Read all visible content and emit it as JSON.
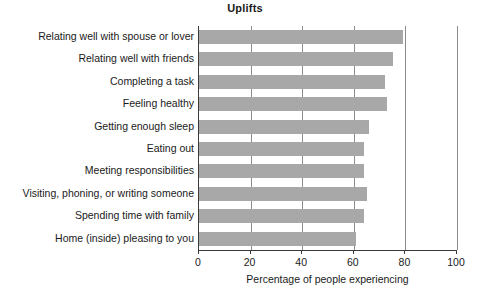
{
  "chart_data": {
    "type": "bar",
    "orientation": "horizontal",
    "title": "Uplifts",
    "xlabel": "Percentage of people experiencing",
    "ylabel": "",
    "xlim": [
      0,
      100
    ],
    "xticks": [
      0,
      20,
      40,
      60,
      80,
      100
    ],
    "grid": true,
    "legend": false,
    "bar_color": "#a8a8a8",
    "axis_color": "#3a3a3a",
    "gridline_color": "#8c8c8c",
    "categories": [
      "Relating well with spouse or lover",
      "Relating well with friends",
      "Completing a task",
      "Feeling healthy",
      "Getting enough sleep",
      "Eating out",
      "Meeting responsibilities",
      "Visiting, phoning, or writing someone",
      "Spending time with family",
      "Home (inside) pleasing to you"
    ],
    "values": [
      79,
      75,
      72,
      73,
      66,
      64,
      64,
      65,
      64,
      61
    ]
  }
}
